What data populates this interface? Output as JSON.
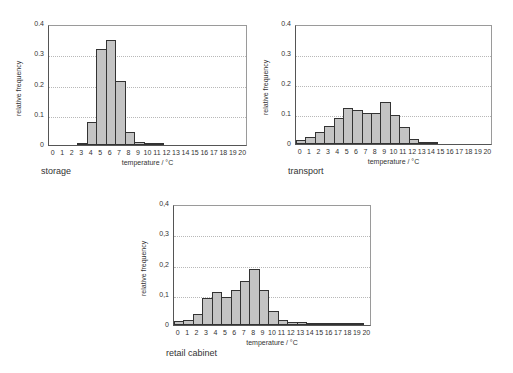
{
  "chart_data": [
    {
      "type": "bar",
      "title": "storage",
      "xlabel": "temperature / °C",
      "ylabel": "relative frequency",
      "ylim": [
        0,
        0.4
      ],
      "yticks": [
        "0",
        "0.1",
        "0.2",
        "0.3",
        "0.4"
      ],
      "categories": [
        "0",
        "1",
        "2",
        "3",
        "4",
        "5",
        "6",
        "7",
        "8",
        "9",
        "10",
        "11",
        "12",
        "13",
        "14",
        "15",
        "16",
        "17",
        "18",
        "19",
        "20"
      ],
      "values": [
        0,
        0,
        0,
        0.002,
        0.077,
        0.318,
        0.347,
        0.212,
        0.043,
        0.009,
        0.004,
        0.001,
        0,
        0,
        0,
        0,
        0,
        0,
        0,
        0,
        0
      ],
      "grid": true
    },
    {
      "type": "bar",
      "title": "transport",
      "xlabel": "temperature / °C",
      "ylabel": "relative frequency",
      "ylim": [
        0,
        0.4
      ],
      "yticks": [
        "0",
        "0.1",
        "0.2",
        "0.3",
        "0.4"
      ],
      "categories": [
        "0",
        "1",
        "2",
        "3",
        "4",
        "5",
        "6",
        "7",
        "8",
        "9",
        "10",
        "11",
        "12",
        "13",
        "14",
        "15",
        "16",
        "17",
        "18",
        "19",
        "20"
      ],
      "values": [
        0.012,
        0.022,
        0.04,
        0.06,
        0.087,
        0.12,
        0.115,
        0.102,
        0.102,
        0.14,
        0.097,
        0.056,
        0.018,
        0.008,
        0.002,
        0,
        0,
        0,
        0,
        0,
        0
      ],
      "grid": true
    },
    {
      "type": "bar",
      "title": "retail cabinet",
      "xlabel": "temperature / °C",
      "ylabel": "relative frequency",
      "ylim": [
        0,
        0.4
      ],
      "yticks": [
        "0",
        "0,1",
        "0,2",
        "0,3",
        "0,4"
      ],
      "categories": [
        "0",
        "1",
        "2",
        "3",
        "4",
        "5",
        "6",
        "7",
        "8",
        "9",
        "10",
        "11",
        "12",
        "13",
        "14",
        "15",
        "16",
        "17",
        "18",
        "19",
        "20"
      ],
      "values": [
        0.012,
        0.016,
        0.038,
        0.09,
        0.108,
        0.092,
        0.115,
        0.145,
        0.185,
        0.115,
        0.047,
        0.015,
        0.011,
        0.011,
        0.007,
        0.003,
        0.002,
        0.002,
        0.001,
        0.001,
        0
      ],
      "grid": true
    }
  ],
  "captions": {
    "storage": "storage",
    "transport": "transport",
    "retail": "retail cabinet"
  }
}
